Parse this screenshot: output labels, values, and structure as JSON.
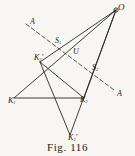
{
  "figure": {
    "caption": "Fig. 116",
    "colors": {
      "ink": "#1d1a17",
      "paper": "#f7f6f3",
      "line": "#2a2724"
    },
    "points": {
      "O": {
        "label": "O",
        "sub": "",
        "prime": "",
        "x": 116,
        "y": 10
      },
      "S1": {
        "label": "S",
        "sub": "1",
        "prime": "",
        "x": 60,
        "y": 45
      },
      "U": {
        "label": "U",
        "sub": "",
        "prime": "",
        "x": 77,
        "y": 55
      },
      "S2": {
        "label": "S",
        "sub": "2",
        "prime": "",
        "x": 95,
        "y": 72
      },
      "K1": {
        "label": "K",
        "sub": "1",
        "prime": "",
        "x": 14,
        "y": 98
      },
      "K2": {
        "label": "K",
        "sub": "2",
        "prime": "",
        "x": 84,
        "y": 98
      },
      "K3": {
        "label": "K",
        "sub": "3",
        "prime": "'",
        "x": 40,
        "y": 62
      },
      "K3p": {
        "label": "K",
        "sub": "3",
        "prime": "'",
        "x": 70,
        "y": 135
      }
    },
    "labels": [
      {
        "name": "point-label-O",
        "text": "O",
        "sub": "",
        "prime": "",
        "x": 118,
        "y": 3,
        "size": "sz-lg"
      },
      {
        "name": "point-label-S1",
        "text": "S",
        "sub": "1",
        "prime": "",
        "x": 55,
        "y": 37,
        "size": "sz-md"
      },
      {
        "name": "point-label-U",
        "text": "U",
        "sub": "",
        "prime": "",
        "x": 73,
        "y": 48,
        "size": "sz-md"
      },
      {
        "name": "point-label-S2",
        "text": "S",
        "sub": "2",
        "prime": "",
        "x": 92,
        "y": 64,
        "size": "sz-md"
      },
      {
        "name": "point-label-K3",
        "text": "K",
        "sub": "3",
        "prime": "'",
        "x": 34,
        "y": 54,
        "size": "sz-md"
      },
      {
        "name": "point-label-K1",
        "text": "K",
        "sub": "1",
        "prime": "",
        "x": 8,
        "y": 97,
        "size": "sz-md"
      },
      {
        "name": "point-label-K2",
        "text": "K",
        "sub": "2",
        "prime": "",
        "x": 80,
        "y": 96,
        "size": "sz-md"
      },
      {
        "name": "point-label-K3p",
        "text": "K",
        "sub": "3",
        "prime": "'",
        "x": 68,
        "y": 134,
        "size": "sz-md"
      },
      {
        "name": "axis-label-A-upper",
        "text": "A",
        "sub": "",
        "prime": "",
        "x": 30,
        "y": 18,
        "size": "sz-md"
      },
      {
        "name": "axis-label-A-lower",
        "text": "A",
        "sub": "",
        "prime": "",
        "x": 117,
        "y": 90,
        "size": "sz-md"
      }
    ],
    "segments": [
      {
        "name": "ray-O-to-K1",
        "x1": 116,
        "y1": 10,
        "x2": 14,
        "y2": 98,
        "style": "solid"
      },
      {
        "name": "ray-O-to-K3",
        "x1": 116,
        "y1": 10,
        "x2": 40,
        "y2": 62,
        "style": "solid"
      },
      {
        "name": "ray-O-to-K3p",
        "x1": 116,
        "y1": 10,
        "x2": 70,
        "y2": 135,
        "style": "solid"
      },
      {
        "name": "ray-O-to-K2",
        "x1": 116,
        "y1": 10,
        "x2": 84,
        "y2": 98,
        "style": "solid"
      },
      {
        "name": "side-K1-K2",
        "x1": 14,
        "y1": 98,
        "x2": 84,
        "y2": 98,
        "style": "solid"
      },
      {
        "name": "side-K3-K2",
        "x1": 40,
        "y1": 62,
        "x2": 84,
        "y2": 98,
        "style": "solid"
      },
      {
        "name": "side-K3-K3p",
        "x1": 40,
        "y1": 62,
        "x2": 70,
        "y2": 135,
        "style": "solid"
      },
      {
        "name": "axis-A-A",
        "x1": 26,
        "y1": 24,
        "x2": 114,
        "y2": 90,
        "style": "dashed"
      }
    ],
    "dots": [
      {
        "name": "vertex-dot-O",
        "x": 116,
        "y": 10,
        "r": 2.1
      }
    ]
  }
}
